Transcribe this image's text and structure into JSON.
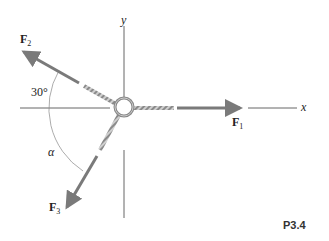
{
  "diagram": {
    "axes": {
      "x_label": "x",
      "y_label": "y"
    },
    "forces": [
      {
        "name": "F",
        "sub": "1",
        "direction": "along +x"
      },
      {
        "name": "F",
        "sub": "2",
        "direction": "upper-left, 30° above -x"
      },
      {
        "name": "F",
        "sub": "3",
        "direction": "lower-left, angle alpha"
      }
    ],
    "angles": {
      "angle_1": "30°",
      "angle_2": "α"
    },
    "figure_tag": "P3.4",
    "colors": {
      "arrow": "#7a7a7a",
      "axis": "#555555",
      "rope": "#9a9a9a"
    }
  }
}
